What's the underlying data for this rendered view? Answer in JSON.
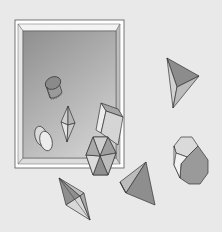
{
  "scene": {
    "title": "Geometric solids puzzle",
    "background": "#e9e9e9",
    "tray": {
      "label": "tray",
      "outer_frame": "#ffffff",
      "bevel_light": "#f4f4f4",
      "bevel_dark": "#bdbdbd",
      "inner_top": "#999999",
      "inner_bottom": "#c8c8c8",
      "stroke": "#555555"
    },
    "pieces": [
      {
        "id": "cylinder-in-tray",
        "kind": "cylinder",
        "location": "inside tray"
      },
      {
        "id": "bipyramid-in-tray",
        "kind": "triangular bipyramid",
        "location": "inside tray"
      },
      {
        "id": "double-disc-in-tray",
        "kind": "flat cylinder pair",
        "location": "inside tray"
      },
      {
        "id": "rectangular-prism",
        "kind": "rectangular prism",
        "location": "tray edge"
      },
      {
        "id": "hexagonal-pyramid",
        "kind": "hexagonal pyramid (top view)",
        "location": "tray bottom edge"
      },
      {
        "id": "tetrahedron-right",
        "kind": "tetrahedron",
        "location": "top right"
      },
      {
        "id": "octagonal-prism",
        "kind": "octagonal prism",
        "location": "right"
      },
      {
        "id": "tetrahedron-bottom",
        "kind": "tetrahedron",
        "location": "bottom center"
      },
      {
        "id": "bipyramid-bottom",
        "kind": "square bipyramid",
        "location": "bottom left"
      }
    ],
    "colors": {
      "face_dark": "#8c8c8c",
      "face_mid": "#a8a8a8",
      "face_light": "#cfcfcf",
      "face_white": "#ececec",
      "edge": "#333333"
    }
  }
}
